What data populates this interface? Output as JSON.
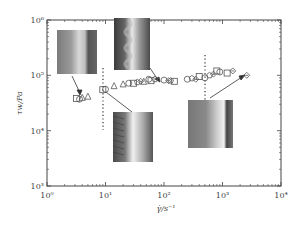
{
  "chart_data": {
    "type": "scatter",
    "title": "",
    "xlabel": "γ̇/s⁻¹",
    "ylabel": "τw/Pa",
    "xscale": "log",
    "yscale": "log",
    "xlim": [
      1,
      10000
    ],
    "ylim": [
      1000,
      1000000
    ],
    "x_ticks": [
      "10⁰",
      "10¹",
      "10²",
      "10³",
      "10⁴"
    ],
    "y_ticks": [
      "10³",
      "10⁴",
      "10⁵",
      "10⁶"
    ],
    "grid": false,
    "legend": null,
    "vertical_dotted_lines_x": [
      9,
      500
    ],
    "series": [
      {
        "name": "squares",
        "marker": "square",
        "points": [
          [
            3.2,
            38000
          ],
          [
            9,
            55000
          ],
          [
            30,
            72000
          ],
          [
            60,
            80000
          ],
          [
            150,
            78000
          ],
          [
            400,
            95000
          ],
          [
            800,
            120000
          ],
          [
            1200,
            110000
          ]
        ]
      },
      {
        "name": "triangles",
        "marker": "triangle",
        "points": [
          [
            4,
            40000
          ],
          [
            5,
            42000
          ],
          [
            14,
            65000
          ],
          [
            20,
            70000
          ],
          [
            45,
            78000
          ]
        ]
      },
      {
        "name": "circles",
        "marker": "circle",
        "points": [
          [
            3.6,
            37000
          ],
          [
            10,
            56000
          ],
          [
            25,
            72000
          ],
          [
            55,
            85000
          ],
          [
            100,
            82000
          ],
          [
            250,
            85000
          ],
          [
            500,
            90000
          ],
          [
            900,
            115000
          ]
        ]
      },
      {
        "name": "pentagons",
        "marker": "pentagon",
        "points": [
          [
            35,
            75000
          ],
          [
            70,
            85000
          ],
          [
            130,
            80000
          ],
          [
            300,
            88000
          ],
          [
            600,
            100000
          ]
        ]
      },
      {
        "name": "diamonds",
        "marker": "diamond",
        "points": [
          [
            40,
            78000
          ],
          [
            120,
            80000
          ],
          [
            350,
            85000
          ],
          [
            700,
            105000
          ],
          [
            1500,
            120000
          ],
          [
            2600,
            100000
          ]
        ]
      }
    ],
    "insets": [
      {
        "description": "smooth extrudate surface (low shear rate)",
        "arrow_to": [
          3.5,
          38000
        ]
      },
      {
        "description": "sharkskin/wavy extrudate surface",
        "arrow_to": [
          100,
          82000
        ]
      },
      {
        "description": "helical/periodic distortion extrudate",
        "arrow_to": [
          9,
          55000
        ]
      },
      {
        "description": "smooth extrudate surface (high shear rate)",
        "arrow_to": [
          2600,
          100000
        ]
      }
    ]
  },
  "axes": {
    "x_tick_labels": [
      "10⁰",
      "10¹",
      "10²",
      "10³",
      "10⁴"
    ],
    "y_tick_labels": [
      "10³",
      "10⁴",
      "10⁵",
      "10⁶"
    ],
    "xlabel": "γ̇/s⁻¹",
    "ylabel": "τw/Pa"
  }
}
